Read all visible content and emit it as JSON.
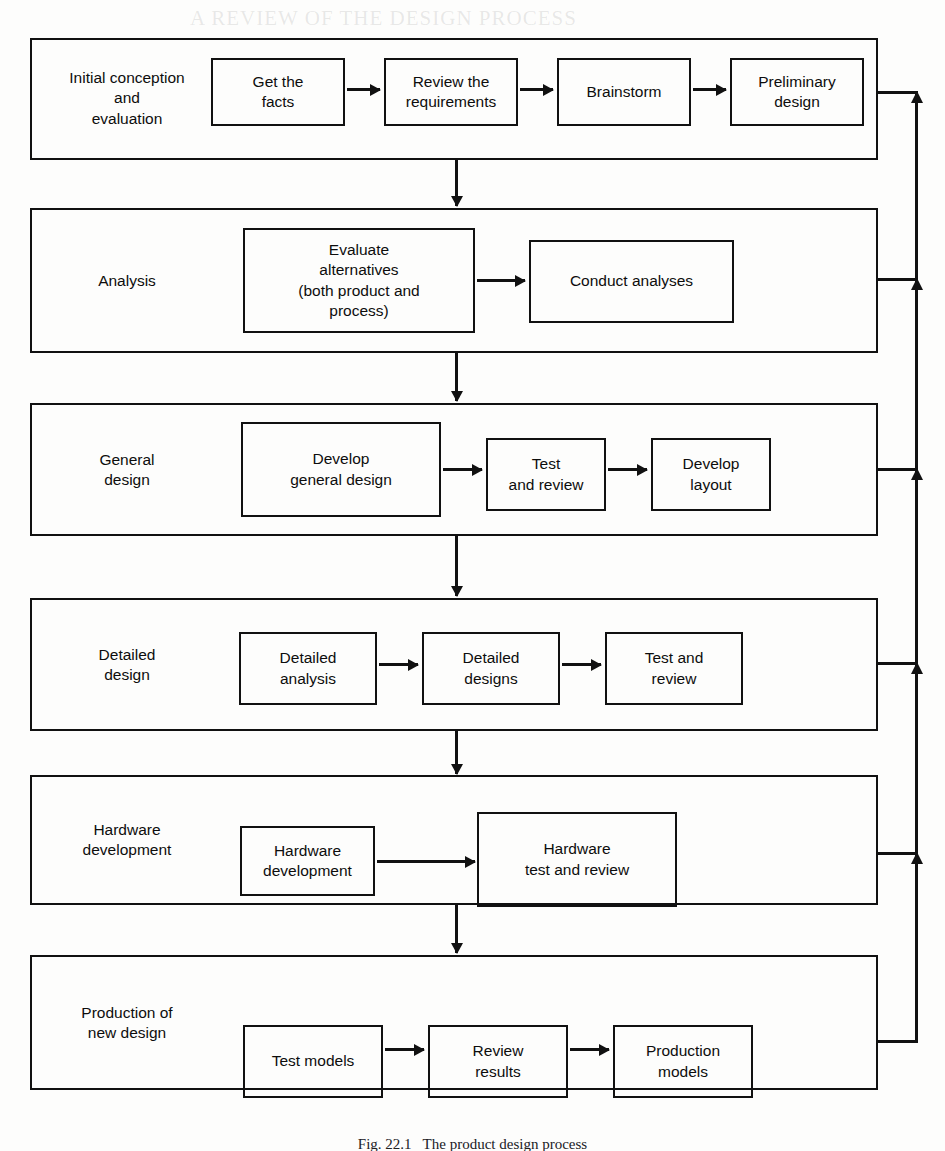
{
  "figure": {
    "caption": "Fig. 22.1   The product design process",
    "ink_color": "#111111",
    "paper_color": "#fdfdfc"
  },
  "bleed_text": {
    "top": "A REVIEW OF THE DESIGN PROCESS"
  },
  "bands": [
    {
      "id": "initial-conception",
      "label": "Initial conception\nand\nevaluation",
      "nodes": [
        {
          "id": "get-the-facts",
          "label": "Get the\nfacts"
        },
        {
          "id": "review-requirements",
          "label": "Review the\nrequirements"
        },
        {
          "id": "brainstorm",
          "label": "Brainstorm"
        },
        {
          "id": "preliminary-design",
          "label": "Preliminary\ndesign"
        }
      ]
    },
    {
      "id": "analysis",
      "label": "Analysis",
      "nodes": [
        {
          "id": "evaluate-alternatives",
          "label": "Evaluate\nalternatives\n(both product and\nprocess)"
        },
        {
          "id": "conduct-analyses",
          "label": "Conduct analyses"
        }
      ]
    },
    {
      "id": "general-design",
      "label": "General\ndesign",
      "nodes": [
        {
          "id": "develop-general-design",
          "label": "Develop\ngeneral design"
        },
        {
          "id": "test-and-review-general",
          "label": "Test\nand review"
        },
        {
          "id": "develop-layout",
          "label": "Develop\nlayout"
        }
      ]
    },
    {
      "id": "detailed-design",
      "label": "Detailed\ndesign",
      "nodes": [
        {
          "id": "detailed-analysis",
          "label": "Detailed\nanalysis"
        },
        {
          "id": "detailed-designs",
          "label": "Detailed\ndesigns"
        },
        {
          "id": "test-and-review-detailed",
          "label": "Test and\nreview"
        }
      ]
    },
    {
      "id": "hardware-development",
      "label": "Hardware\ndevelopment",
      "nodes": [
        {
          "id": "hardware-development-node",
          "label": "Hardware\ndevelopment"
        },
        {
          "id": "hardware-test-and-review",
          "label": "Hardware\ntest and review"
        }
      ]
    },
    {
      "id": "production-of-new-design",
      "label": "Production of\nnew design",
      "nodes": [
        {
          "id": "test-models",
          "label": "Test models"
        },
        {
          "id": "review-results",
          "label": "Review\nresults"
        },
        {
          "id": "production-models",
          "label": "Production\nmodels"
        }
      ]
    }
  ]
}
